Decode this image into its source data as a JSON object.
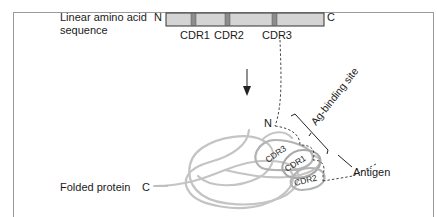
{
  "labels": {
    "linear_line1": "Linear amino acid",
    "linear_line2": "sequence",
    "folded": "Folded protein",
    "n_terminus": "N",
    "c_terminus": "C",
    "cdr1": "CDR1",
    "cdr2": "CDR2",
    "cdr3": "CDR3",
    "ag_binding_site": "Ag-binding site",
    "antigen": "Antigen"
  },
  "colors": {
    "bar_fill": "#d4d4d4",
    "cdr_fill": "#8c8c8c",
    "strand": "#c4c4c4",
    "line": "#2a2a2a"
  }
}
